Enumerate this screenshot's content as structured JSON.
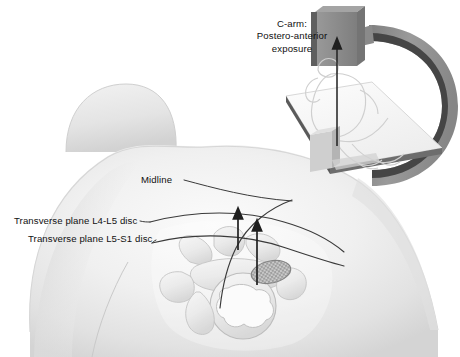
{
  "figure": {
    "type": "medical-illustration",
    "background_color": "#ffffff"
  },
  "labels": {
    "midline": "Midline",
    "transverse_l4_l5": "Transverse plane L4-L5 disc",
    "transverse_l5_s1": "Transverse plane L5-S1 disc"
  },
  "inset": {
    "caption_line1": "C-arm:",
    "caption_line2": "Postero-anterior",
    "caption_line3": "exposure"
  },
  "colors": {
    "skin_fill": "#efefef",
    "skin_shadow": "#d9d9d9",
    "line": "#3a3a3a",
    "bone_fill": "#e8e8e8",
    "bone_line": "#9a9a9a",
    "disc_fill": "#6f6f6f",
    "carm_outer": "#8d8d8d",
    "carm_inner": "#3f3f3f",
    "emitter_face": "#8f8f8f",
    "emitter_side": "#6a6a6a",
    "table_top": "#f4f4f4",
    "table_edge": "#5a5a5a",
    "patient_outline": "#cfcfcf",
    "text": "#111111"
  },
  "annotations": {
    "arrow_l4_l5": "upward arrow from L4-L5 disc level to transverse plane line",
    "arrow_l5_s1": "upward arrow from L5-S1 disc level to transverse plane line",
    "beam_arrow": "vertical X-ray beam arrow from detector up to emitter"
  }
}
